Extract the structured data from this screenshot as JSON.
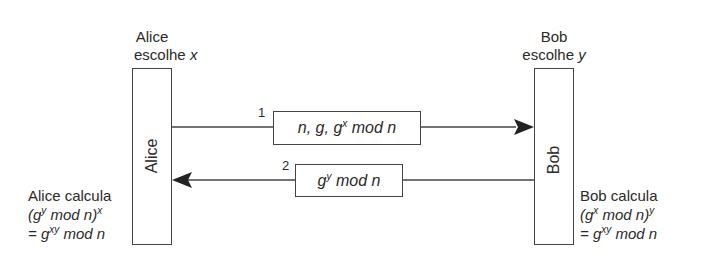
{
  "diagram": {
    "alice": {
      "name": "Alice",
      "choose_prefix": "escolhe",
      "choose_var": "x",
      "calc_title": "Alice calcula",
      "calc_line1_open": "(g",
      "calc_line1_sup1": "y",
      "calc_line1_mid": " mod n)",
      "calc_line1_sup2": "x",
      "calc_line2_prefix": "= g",
      "calc_line2_sup": "xy",
      "calc_line2_suffix": " mod n"
    },
    "bob": {
      "name": "Bob",
      "choose_prefix": "escolhe",
      "choose_var": "y",
      "calc_title": "Bob calcula",
      "calc_line1_open": "(g",
      "calc_line1_sup1": "x",
      "calc_line1_mid": " mod n)",
      "calc_line1_sup2": "y",
      "calc_line2_prefix": "= g",
      "calc_line2_sup": "xy",
      "calc_line2_suffix": " mod n"
    },
    "messages": [
      {
        "step": "1",
        "direction": "alice-to-bob",
        "text_prefix": "n, g, g",
        "text_sup": "x",
        "text_suffix": " mod n"
      },
      {
        "step": "2",
        "direction": "bob-to-alice",
        "text_prefix": "g",
        "text_sup": "y",
        "text_suffix": " mod n"
      }
    ],
    "colors": {
      "line": "#444444",
      "text": "#2a2a2a",
      "background": "#ffffff"
    }
  }
}
